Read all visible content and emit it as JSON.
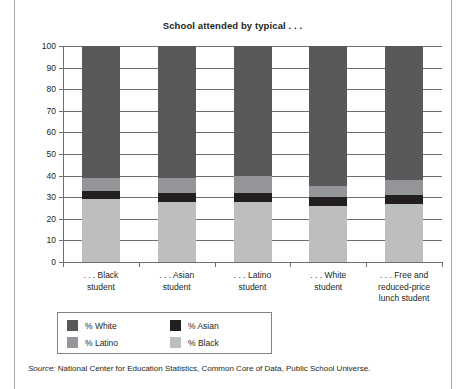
{
  "chart_data": {
    "type": "bar",
    "subtype": "stacked-100",
    "title": "School attended by typical . . .",
    "xlabel": "",
    "ylabel": "",
    "ylim": [
      0,
      100
    ],
    "ytick_step": 10,
    "yticks": [
      0,
      10,
      20,
      30,
      40,
      50,
      60,
      70,
      80,
      90,
      100
    ],
    "grid": true,
    "legend_position": "below-plot-left",
    "categories": [
      "... Black student",
      "... Asian student",
      "... Latino student",
      "... White student",
      "... Free and reduced-price lunch student"
    ],
    "category_lines": [
      [
        ". . . Black",
        "student"
      ],
      [
        ". . . Asian",
        "student"
      ],
      [
        ". . . Latino",
        "student"
      ],
      [
        ". . . White",
        "student"
      ],
      [
        ". . . Free and",
        "reduced-price",
        "lunch student"
      ]
    ],
    "stack_order_bottom_to_top": [
      "% Black",
      "% Asian",
      "% Latino",
      "% White"
    ],
    "series": [
      {
        "name": "% Black",
        "color": "#bcbec0",
        "values": [
          29,
          28,
          28,
          26,
          27
        ]
      },
      {
        "name": "% Asian",
        "color": "#231f20",
        "values": [
          4,
          4,
          4,
          4,
          4
        ]
      },
      {
        "name": "% Latino",
        "color": "#939598",
        "values": [
          6,
          7,
          8,
          5,
          7
        ]
      },
      {
        "name": "% White",
        "color": "#58595b",
        "values": [
          61,
          61,
          60,
          65,
          62
        ]
      }
    ],
    "source": "Source: National Center for Education Statistics, Common Core of Data, Public School Universe."
  },
  "legend": {
    "entries": [
      {
        "label": "% White",
        "color": "#58595b"
      },
      {
        "label": "% Asian",
        "color": "#231f20"
      },
      {
        "label": "% Latino",
        "color": "#939598"
      },
      {
        "label": "% Black",
        "color": "#bcbec0"
      }
    ]
  },
  "source": {
    "prefix": "Source:",
    "text": " National Center for Education Statistics, Common Core of Data, Public School Universe."
  },
  "colors": {
    "axis": "#6d6e71",
    "text": "#231f20",
    "frame": "#a7a9ac",
    "background": "#ffffff"
  }
}
